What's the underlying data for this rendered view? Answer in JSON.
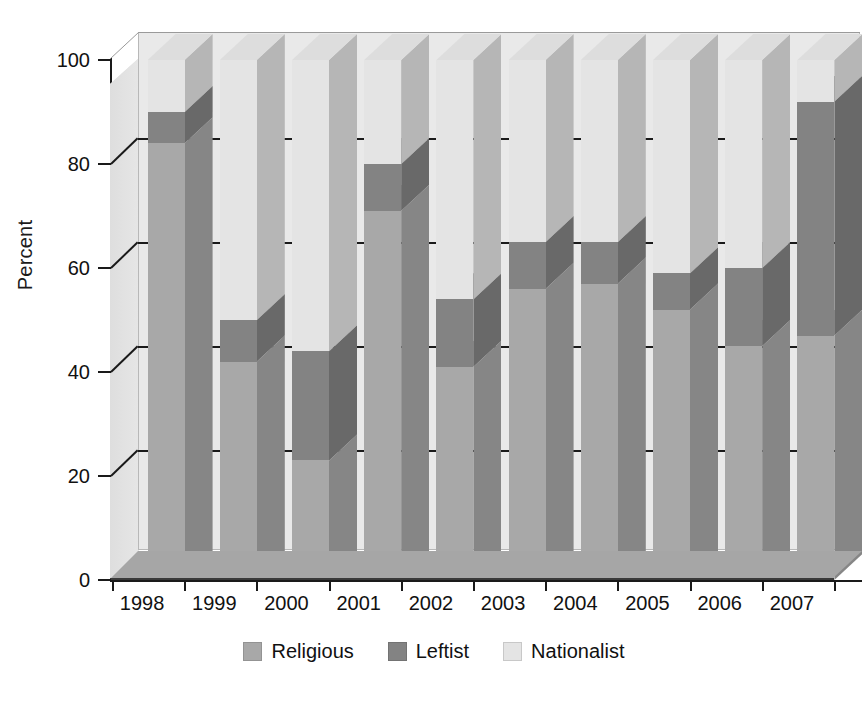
{
  "chart_data": {
    "type": "bar",
    "subtype": "stacked-100-percent-3d",
    "title": "",
    "xlabel": "",
    "ylabel": "Percent",
    "ylim": [
      0,
      100
    ],
    "yticks": [
      0,
      20,
      40,
      60,
      80,
      100
    ],
    "grid": true,
    "legend_position": "bottom-center",
    "categories": [
      "1998",
      "1999",
      "2000",
      "2001",
      "2002",
      "2003",
      "2004",
      "2005",
      "2006",
      "2007"
    ],
    "series": [
      {
        "name": "Religious",
        "color": "#a8a8a8",
        "values": [
          84,
          42,
          23,
          71,
          41,
          56,
          57,
          52,
          45,
          47
        ]
      },
      {
        "name": "Leftist",
        "color": "#838383",
        "values": [
          6,
          8,
          21,
          9,
          13,
          9,
          8,
          7,
          15,
          45
        ]
      },
      {
        "name": "Nationalist",
        "color": "#e4e4e4",
        "values": [
          10,
          50,
          56,
          20,
          46,
          35,
          35,
          41,
          40,
          8
        ]
      }
    ]
  },
  "axes": {
    "y_title": "Percent",
    "y_tick_labels": [
      "100",
      "80",
      "60",
      "40",
      "20",
      "0"
    ],
    "x_tick_labels": [
      "1998",
      "1999",
      "2000",
      "2001",
      "2002",
      "2003",
      "2004",
      "2005",
      "2006",
      "2007"
    ]
  },
  "legend": {
    "items": [
      {
        "label": "Religious",
        "color": "#a8a8a8"
      },
      {
        "label": "Leftist",
        "color": "#838383"
      },
      {
        "label": "Nationalist",
        "color": "#e4e4e4"
      }
    ]
  },
  "colors": {
    "religious": "#a8a8a8",
    "leftist": "#838383",
    "nationalist": "#e4e4e4",
    "back_wall": "#e9e9e9",
    "floor": "#a6a6a6",
    "axis": "#1a1a1a"
  }
}
